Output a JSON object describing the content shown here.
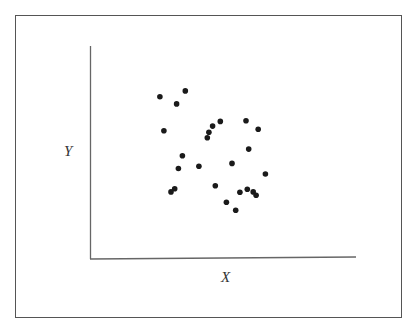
{
  "chart_data": {
    "type": "scatter",
    "title": "",
    "xlabel": "X",
    "ylabel": "Y",
    "xlim": [
      0,
      100
    ],
    "ylim": [
      0,
      100
    ],
    "grid": false,
    "legend": null,
    "ticks": "none",
    "marker_color": "#1a1a1a",
    "points": [
      {
        "x": 26.0,
        "y": 76.2
      },
      {
        "x": 35.6,
        "y": 78.9
      },
      {
        "x": 32.3,
        "y": 72.8
      },
      {
        "x": 27.5,
        "y": 60.2
      },
      {
        "x": 45.9,
        "y": 62.4
      },
      {
        "x": 48.8,
        "y": 64.6
      },
      {
        "x": 44.5,
        "y": 59.5
      },
      {
        "x": 43.9,
        "y": 56.9
      },
      {
        "x": 58.5,
        "y": 64.9
      },
      {
        "x": 63.1,
        "y": 60.9
      },
      {
        "x": 59.5,
        "y": 51.6
      },
      {
        "x": 34.5,
        "y": 48.5
      },
      {
        "x": 33.0,
        "y": 42.5
      },
      {
        "x": 40.7,
        "y": 43.5
      },
      {
        "x": 53.2,
        "y": 44.9
      },
      {
        "x": 65.8,
        "y": 39.9
      },
      {
        "x": 46.9,
        "y": 34.4
      },
      {
        "x": 31.6,
        "y": 33.0
      },
      {
        "x": 30.2,
        "y": 31.5
      },
      {
        "x": 56.2,
        "y": 31.3
      },
      {
        "x": 59.0,
        "y": 32.7
      },
      {
        "x": 61.2,
        "y": 31.5
      },
      {
        "x": 62.3,
        "y": 29.9
      },
      {
        "x": 51.1,
        "y": 26.6
      },
      {
        "x": 54.6,
        "y": 22.9
      }
    ]
  },
  "labels": {
    "x": "X",
    "y": "Y"
  }
}
